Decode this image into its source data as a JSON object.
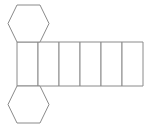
{
  "figure": {
    "name": "hexagonal-prism-net",
    "background_color": "#ffffff",
    "stroke_color": "#8a8a8a",
    "fill_color": "#ffffff",
    "stroke_width": 1,
    "canvas": {
      "width": 152,
      "height": 132
    }
  },
  "chart_data": {
    "type": "diagram",
    "shape_counts": {
      "hexagons": 2,
      "rectangles": 6,
      "total_faces": 8
    },
    "units": "pixels",
    "strip": {
      "name": "lateral-face-strip",
      "cell_count": 6,
      "x_start": 17,
      "x_end": 143,
      "y_top": 42,
      "y_bottom": 86,
      "cell_width": 21,
      "cell_height": 44,
      "divider_x": [
        17,
        38,
        59,
        80,
        101,
        122,
        143
      ]
    },
    "hexagons": [
      {
        "name": "top-hexagon",
        "orientation": "flat-top",
        "center": [
          28.5,
          23.5
        ],
        "width": 42,
        "height": 38,
        "points": [
          [
            17,
            5
          ],
          [
            40,
            5
          ],
          [
            49,
            23.5
          ],
          [
            40,
            42
          ],
          [
            17,
            42
          ],
          [
            8,
            23.5
          ]
        ],
        "attached_edge": "bottom",
        "attached_to_cell": 1
      },
      {
        "name": "bottom-hexagon",
        "orientation": "flat-top",
        "center": [
          28.5,
          104.5
        ],
        "width": 42,
        "height": 38,
        "points": [
          [
            17,
            86
          ],
          [
            40,
            86
          ],
          [
            49,
            104.5
          ],
          [
            40,
            123
          ],
          [
            17,
            123
          ],
          [
            8,
            104.5
          ]
        ],
        "attached_edge": "top",
        "attached_to_cell": 1
      }
    ],
    "rectangles": [
      {
        "name": "rect-1",
        "index": 1,
        "x": 17,
        "y": 42,
        "width": 21,
        "height": 44
      },
      {
        "name": "rect-2",
        "index": 2,
        "x": 38,
        "y": 42,
        "width": 21,
        "height": 44
      },
      {
        "name": "rect-3",
        "index": 3,
        "x": 59,
        "y": 42,
        "width": 21,
        "height": 44
      },
      {
        "name": "rect-4",
        "index": 4,
        "x": 80,
        "y": 42,
        "width": 21,
        "height": 44
      },
      {
        "name": "rect-5",
        "index": 5,
        "x": 101,
        "y": 42,
        "width": 21,
        "height": 44
      },
      {
        "name": "rect-6",
        "index": 6,
        "x": 122,
        "y": 42,
        "width": 21,
        "height": 44
      }
    ]
  }
}
